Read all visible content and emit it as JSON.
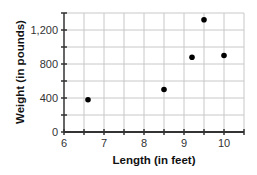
{
  "chart_data": {
    "type": "scatter",
    "title": "",
    "xlabel": "Length (in feet)",
    "ylabel": "Weight (in pounds)",
    "xlim": [
      6,
      10.5
    ],
    "ylim": [
      0,
      1400
    ],
    "x_ticks": [
      6,
      7,
      8,
      9,
      10
    ],
    "x_tick_labels": [
      "6",
      "7",
      "8",
      "9",
      "10"
    ],
    "y_ticks": [
      0,
      400,
      800,
      1200
    ],
    "y_tick_labels": [
      "0",
      "400",
      "800",
      "1,200"
    ],
    "x_minor_step": 0.5,
    "y_minor_step": 200,
    "grid": true,
    "legend": null,
    "points": [
      {
        "x": 6.6,
        "y": 380
      },
      {
        "x": 8.5,
        "y": 500
      },
      {
        "x": 9.2,
        "y": 880
      },
      {
        "x": 9.5,
        "y": 1320
      },
      {
        "x": 10,
        "y": 900
      }
    ],
    "colors": {
      "point": "#000000",
      "grid": "#c8c8c8",
      "axis": "#333333"
    }
  }
}
